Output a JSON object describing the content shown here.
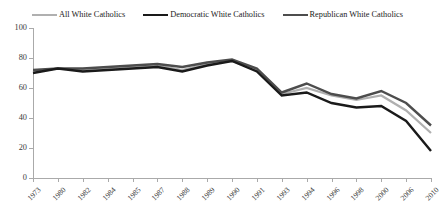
{
  "chart_data": {
    "type": "line",
    "title": "",
    "subtitle": "",
    "xlabel": "",
    "ylabel": "",
    "ylim": [
      0,
      100
    ],
    "yticks": [
      0,
      20,
      40,
      60,
      80,
      100
    ],
    "grid": false,
    "legend_position": "top",
    "categories": [
      "1973",
      "1980",
      "1982",
      "1984",
      "1985",
      "1987",
      "1988",
      "1989",
      "1990",
      "1991",
      "1993",
      "1994",
      "1996",
      "1998",
      "2000",
      "2006",
      "2010"
    ],
    "series": [
      {
        "name": "All White Catholics",
        "color": "#b0b0b0",
        "width": 2.2,
        "values": [
          71,
          73,
          72,
          73,
          74,
          75,
          72,
          76,
          78,
          72,
          56,
          60,
          55,
          52,
          55,
          45,
          30
        ]
      },
      {
        "name": "Democratic White Catholics",
        "color": "#1a1a1a",
        "width": 2.4,
        "values": [
          70,
          73,
          71,
          72,
          73,
          74,
          71,
          75,
          78,
          71,
          55,
          57,
          50,
          47,
          48,
          38,
          18
        ]
      },
      {
        "name": "Republican White Catholics",
        "color": "#4d4d4d",
        "width": 2.4,
        "values": [
          72,
          73,
          73,
          74,
          75,
          76,
          74,
          77,
          79,
          73,
          57,
          63,
          56,
          53,
          58,
          50,
          35
        ]
      }
    ]
  },
  "legend": {
    "items": [
      {
        "label": "All White Catholics"
      },
      {
        "label": "Democratic White Catholics"
      },
      {
        "label": "Republican White Catholics"
      }
    ]
  }
}
